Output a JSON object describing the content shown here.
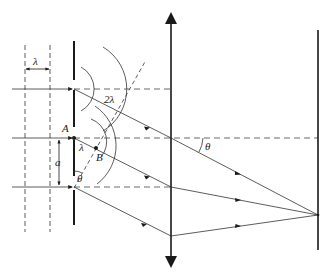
{
  "diagram": {
    "type": "double-slit diffraction with converging lens",
    "labels": {
      "wavelength_top": "λ",
      "path_difference": "2λ",
      "point_a": "A",
      "point_b": "B",
      "lambda_ab": "λ",
      "slit_spacing": "a",
      "theta_slit": "θ",
      "theta_lens": "θ"
    },
    "elements": [
      {
        "name": "incident-wavefronts",
        "kind": "dashed vertical lines",
        "count": 2
      },
      {
        "name": "slit-barrier",
        "kind": "opaque barrier with slits",
        "slits": 3
      },
      {
        "name": "converging-lens",
        "kind": "double-arrow vertical line"
      },
      {
        "name": "screen",
        "kind": "vertical line"
      }
    ],
    "colors": {
      "ink": "#1a1a1a",
      "thin": "#333333"
    }
  }
}
